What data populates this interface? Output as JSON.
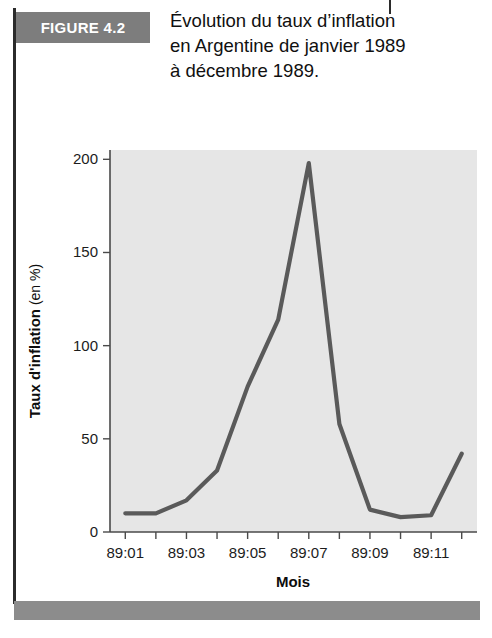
{
  "figure": {
    "badge_label": "FIGURE 4.2",
    "title_lines": [
      "Évolution du taux d’inflation",
      "en Argentine de janvier 1989",
      "à décembre 1989."
    ],
    "badge_color": "#7d7d7d",
    "rule_color": "#2b2b2b",
    "bottom_bar_color": "#8c8c8c"
  },
  "chart_data": {
    "type": "line",
    "title": "",
    "xlabel": "Mois",
    "ylabel_bold": "Taux d'inflation",
    "ylabel_regular": " (en %)",
    "ylabel_full": "Taux d'inflation (en %)",
    "categories": [
      "89:01",
      "89:02",
      "89:03",
      "89:04",
      "89:05",
      "89:06",
      "89:07",
      "89:08",
      "89:09",
      "89:10",
      "89:11",
      "89:12"
    ],
    "x_tick_labels": [
      "89:01",
      "89:03",
      "89:05",
      "89:07",
      "89:09",
      "89:11"
    ],
    "x_tick_label_indices": [
      0,
      2,
      4,
      6,
      8,
      10
    ],
    "y_tick_labels": [
      "0",
      "50",
      "100",
      "150",
      "200"
    ],
    "y_ticks": [
      0,
      50,
      100,
      150,
      200
    ],
    "values": [
      10,
      10,
      17,
      33,
      78,
      114,
      198,
      58,
      12,
      8,
      9,
      42
    ],
    "ylim": [
      0,
      205
    ],
    "grid": false,
    "legend": "none",
    "plot_background": "#e6e6e6",
    "line_color": "#5a5a5a"
  }
}
